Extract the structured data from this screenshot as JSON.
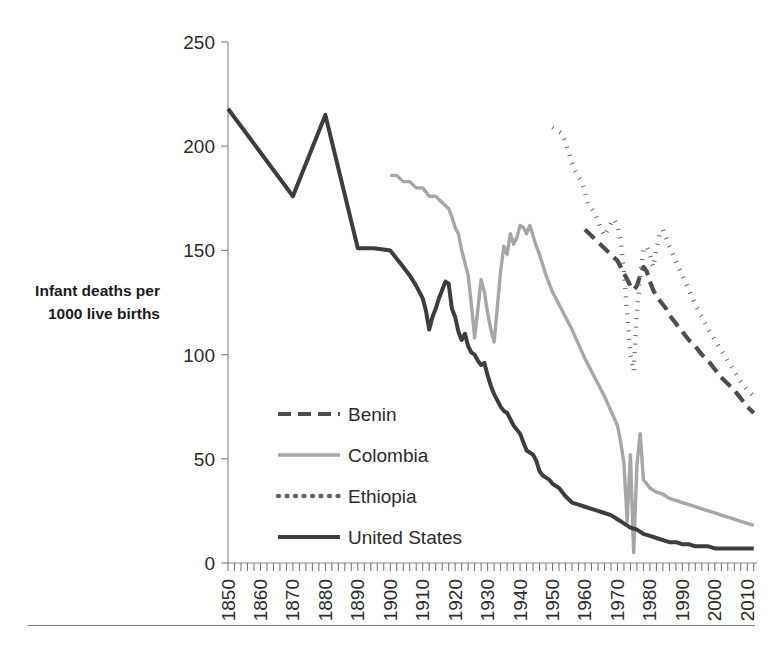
{
  "chart_data": {
    "type": "line",
    "title": "",
    "xlabel": "",
    "ylabel": "Infant deaths per 1000 live births",
    "ylabel_line1": "Infant deaths per",
    "ylabel_line2": "1000 live births",
    "xlim": [
      1850,
      2013
    ],
    "ylim": [
      0,
      250
    ],
    "yticks": [
      0,
      50,
      100,
      150,
      200,
      250
    ],
    "ytick_labels": [
      "0",
      "50",
      "100",
      "150",
      "200",
      "250"
    ],
    "xticks": [
      1850,
      1860,
      1870,
      1880,
      1890,
      1900,
      1910,
      1920,
      1930,
      1940,
      1950,
      1960,
      1970,
      1980,
      1990,
      2000,
      2010
    ],
    "xtick_labels": [
      "1850",
      "1860",
      "1870",
      "1880",
      "1890",
      "1900",
      "1910",
      "1920",
      "1930",
      "1940",
      "1950",
      "1960",
      "1970",
      "1980",
      "1990",
      "2000",
      "2010"
    ],
    "grid": false,
    "legend_position": "inside-lower-left",
    "minor_ticks_x": true,
    "series": [
      {
        "name": "Benin",
        "color": "#4d4d4d",
        "style": "dashed",
        "width": 4.2,
        "dasharray": "13,7",
        "x": [
          1960,
          1962,
          1964,
          1966,
          1968,
          1970,
          1971,
          1972,
          1973,
          1974,
          1975,
          1976,
          1977,
          1978,
          1979,
          1980,
          1981,
          1982,
          1983,
          1984,
          1985,
          1986,
          1988,
          1990,
          1992,
          1994,
          1996,
          1998,
          2000,
          2002,
          2004,
          2006,
          2008,
          2010,
          2012
        ],
        "y": [
          160,
          157,
          154,
          151,
          148,
          145,
          142,
          139,
          136,
          133,
          131,
          133,
          138,
          142,
          140,
          135,
          131,
          128,
          126,
          124,
          122,
          119,
          115,
          111,
          107,
          104,
          100,
          97,
          93,
          89,
          86,
          83,
          79,
          75,
          72
        ]
      },
      {
        "name": "Colombia",
        "color": "#a6a6a6",
        "style": "solid",
        "width": 3.4,
        "dasharray": "",
        "x": [
          1900,
          1902,
          1904,
          1906,
          1908,
          1910,
          1912,
          1914,
          1916,
          1918,
          1919,
          1920,
          1921,
          1922,
          1923,
          1924,
          1925,
          1926,
          1927,
          1928,
          1929,
          1930,
          1931,
          1932,
          1933,
          1934,
          1935,
          1936,
          1937,
          1938,
          1939,
          1940,
          1941,
          1942,
          1943,
          1944,
          1945,
          1946,
          1947,
          1948,
          1950,
          1952,
          1954,
          1956,
          1958,
          1960,
          1962,
          1964,
          1966,
          1968,
          1970,
          1971,
          1972,
          1973,
          1974,
          1975,
          1976,
          1977,
          1978,
          1979,
          1980,
          1982,
          1984,
          1986,
          1988,
          1990,
          1992,
          1994,
          1996,
          1998,
          2000,
          2002,
          2004,
          2006,
          2008,
          2010,
          2012
        ],
        "y": [
          186,
          186,
          183,
          183,
          180,
          180,
          176,
          176,
          173,
          170,
          166,
          161,
          158,
          150,
          144,
          138,
          124,
          108,
          122,
          136,
          130,
          120,
          112,
          106,
          123,
          140,
          152,
          148,
          158,
          153,
          156,
          162,
          161,
          158,
          162,
          157,
          152,
          148,
          143,
          138,
          130,
          124,
          118,
          112,
          105,
          98,
          92,
          86,
          80,
          73,
          66,
          58,
          48,
          20,
          52,
          5,
          47,
          62,
          40,
          38,
          36,
          34,
          33,
          31,
          30,
          29,
          28,
          27,
          26,
          25,
          24,
          23,
          22,
          21,
          20,
          19,
          18
        ]
      },
      {
        "name": "Ethiopia",
        "color": "#666666",
        "style": "dotted",
        "width": 4.4,
        "dasharray": "1,7.5",
        "x": [
          1950,
          1951,
          1952,
          1953,
          1954,
          1955,
          1956,
          1957,
          1958,
          1959,
          1960,
          1961,
          1962,
          1963,
          1964,
          1965,
          1966,
          1967,
          1968,
          1969,
          1970,
          1971,
          1972,
          1973,
          1974,
          1975,
          1976,
          1977,
          1978,
          1979,
          1980,
          1981,
          1982,
          1983,
          1984,
          1986,
          1988,
          1990,
          1992,
          1994,
          1996,
          1998,
          2000,
          2002,
          2004,
          2006,
          2008,
          2010,
          2012
        ],
        "y": [
          209,
          208,
          207,
          206,
          202,
          197,
          192,
          188,
          185,
          183,
          178,
          172,
          170,
          168,
          164,
          160,
          157,
          160,
          163,
          165,
          162,
          155,
          140,
          120,
          100,
          92,
          120,
          138,
          150,
          152,
          148,
          142,
          150,
          158,
          160,
          152,
          145,
          138,
          131,
          124,
          118,
          112,
          107,
          102,
          97,
          92,
          87,
          83,
          80
        ]
      },
      {
        "name": "United States",
        "color": "#3d3d3d",
        "style": "solid",
        "width": 4.0,
        "dasharray": "",
        "x": [
          1850,
          1860,
          1870,
          1880,
          1890,
          1895,
          1900,
          1902,
          1904,
          1906,
          1908,
          1910,
          1911,
          1912,
          1913,
          1914,
          1915,
          1916,
          1917,
          1918,
          1919,
          1920,
          1921,
          1922,
          1923,
          1924,
          1925,
          1926,
          1927,
          1928,
          1929,
          1930,
          1931,
          1932,
          1933,
          1934,
          1935,
          1936,
          1937,
          1938,
          1939,
          1940,
          1941,
          1942,
          1943,
          1944,
          1945,
          1946,
          1947,
          1948,
          1949,
          1950,
          1952,
          1954,
          1956,
          1958,
          1960,
          1962,
          1964,
          1966,
          1968,
          1970,
          1972,
          1974,
          1976,
          1978,
          1980,
          1982,
          1984,
          1986,
          1988,
          1990,
          1992,
          1994,
          1996,
          1998,
          2000,
          2002,
          2004,
          2006,
          2008,
          2010,
          2012
        ],
        "y": [
          218,
          197,
          176,
          215,
          151,
          151,
          150,
          146,
          142,
          138,
          133,
          127,
          121,
          112,
          118,
          122,
          127,
          131,
          135,
          134,
          122,
          118,
          111,
          107,
          110,
          104,
          101,
          100,
          97,
          95,
          96,
          90,
          85,
          81,
          78,
          75,
          73,
          72,
          69,
          66,
          64,
          62,
          58,
          54,
          53,
          52,
          49,
          44,
          42,
          41,
          40,
          38,
          36,
          32,
          29,
          28,
          27,
          26,
          25,
          24,
          23,
          21,
          19,
          17,
          16,
          14,
          13,
          12,
          11,
          10,
          10,
          9,
          9,
          8,
          8,
          8,
          7,
          7,
          7,
          7,
          7,
          7,
          7
        ]
      }
    ]
  },
  "legend": {
    "items": [
      {
        "label": "Benin",
        "color": "#4d4d4d",
        "style": "dashed"
      },
      {
        "label": "Colombia",
        "color": "#a6a6a6",
        "style": "solid"
      },
      {
        "label": "Ethiopia",
        "color": "#666666",
        "style": "dotted"
      },
      {
        "label": "United States",
        "color": "#3d3d3d",
        "style": "solid"
      }
    ]
  }
}
